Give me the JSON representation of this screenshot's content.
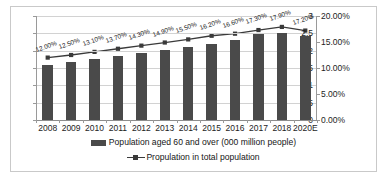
{
  "chart_data": {
    "type": "bar",
    "title": "",
    "subtitle": "",
    "xlabel": "",
    "ylabel": "",
    "y2label": "",
    "grid": true,
    "legend_position": "bottom",
    "categories": [
      "2008",
      "2009",
      "2010",
      "2011",
      "2012",
      "2013",
      "2014",
      "2015",
      "2016",
      "2017",
      "2018",
      "2020E"
    ],
    "ylim": [
      0,
      3
    ],
    "y_ticks": [
      "0",
      "0.5",
      "1",
      "1.5",
      "2",
      "2.5",
      "3"
    ],
    "y_tick_values": [
      0,
      0.5,
      1,
      1.5,
      2,
      2.5,
      3
    ],
    "y2lim": [
      0,
      20
    ],
    "y2_ticks": [
      "0.00%",
      "5.00%",
      "10.00%",
      "15.00%",
      "20.00%"
    ],
    "y2_tick_values": [
      0,
      5,
      10,
      15,
      20
    ],
    "series": [
      {
        "name": "Population aged 60 and over (000 million people)",
        "type": "bar",
        "axis": "left",
        "color": "#4a4a4a",
        "values": [
          1.59,
          1.67,
          1.76,
          1.85,
          1.94,
          2.02,
          2.11,
          2.2,
          2.3,
          2.49,
          2.5,
          2.41
        ]
      },
      {
        "name": "Propulation in total population",
        "type": "line",
        "axis": "right",
        "color": "#3a3a3a",
        "values": [
          12.0,
          12.5,
          13.1,
          13.7,
          14.3,
          14.9,
          15.5,
          16.2,
          16.6,
          17.3,
          17.9,
          17.2
        ],
        "data_labels": [
          "12.00%",
          "12.50%",
          "13.10%",
          "13.70%",
          "14.30%",
          "14.90%",
          "15.50%",
          "16.20%",
          "16.60%",
          "17.30%",
          "17.90%",
          "17.20%"
        ]
      }
    ]
  },
  "legend": {
    "items": [
      {
        "label": "Population aged 60 and over (000 million people)",
        "marker": "bar-swatch"
      },
      {
        "label": "Propulation in total population",
        "marker": "line-swatch"
      }
    ]
  }
}
